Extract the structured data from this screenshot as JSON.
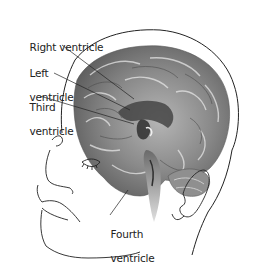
{
  "figure": {
    "labels": [
      {
        "id": "right-ventricle",
        "text": "Right ventricle",
        "lines": [
          "Right ventricle"
        ]
      },
      {
        "id": "left-ventricle",
        "text": "Left ventricle",
        "lines": [
          "Left",
          "ventricle"
        ]
      },
      {
        "id": "third-ventricle",
        "text": "Third ventricle",
        "lines": [
          "Third",
          "ventricle"
        ]
      },
      {
        "id": "fourth-ventricle",
        "text": "Fourth ventricle",
        "lines": [
          "Fourth",
          "ventricle"
        ]
      }
    ],
    "colors": {
      "background": "#ffffff",
      "outline": "#222222",
      "brain_dark": "#5a5a5a",
      "brain_mid": "#8c8c8c",
      "brain_light": "#c8c8c8",
      "label_text": "#222222"
    }
  }
}
